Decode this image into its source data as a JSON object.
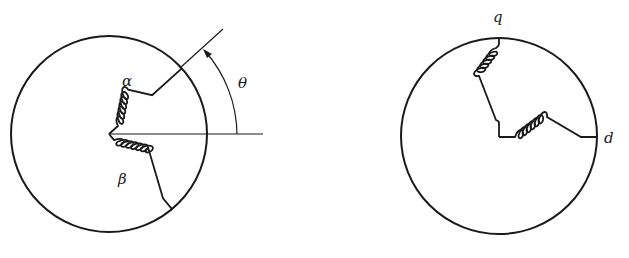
{
  "figure": {
    "left_diagram": {
      "title": "rotor with alpha-beta windings",
      "labels": {
        "alpha": "α",
        "beta": "β",
        "theta": "θ"
      },
      "circle": {
        "cx": 109,
        "cy": 133,
        "r": 98
      }
    },
    "right_diagram": {
      "title": "rotor with d-q windings",
      "labels": {
        "q": "q",
        "d": "d"
      },
      "circle": {
        "cx": 499,
        "cy": 136,
        "r": 99
      }
    },
    "colors": {
      "stroke": "#1a1a1a",
      "background": "#ffffff"
    }
  }
}
